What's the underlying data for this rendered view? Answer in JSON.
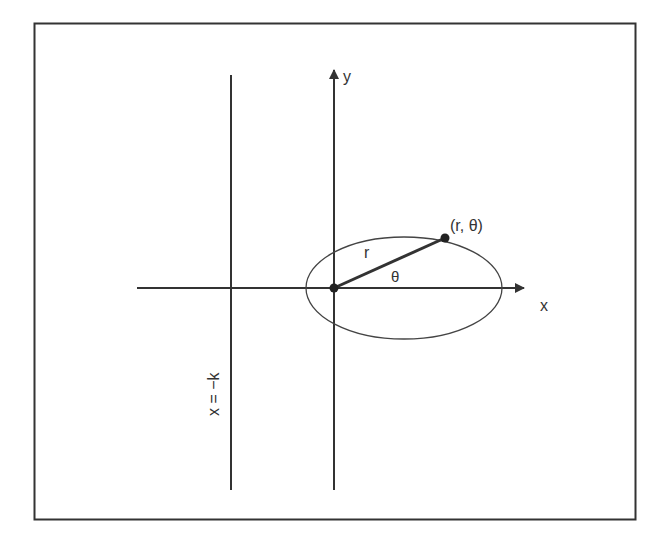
{
  "diagram": {
    "title": "",
    "labels": {
      "y_axis": "y",
      "x_axis": "x",
      "point": "(r, θ)",
      "radius": "r",
      "angle": "θ",
      "directrix": "x = −k"
    },
    "colors": {
      "frame": "#333333",
      "line": "#333333",
      "background": "#ffffff"
    }
  }
}
